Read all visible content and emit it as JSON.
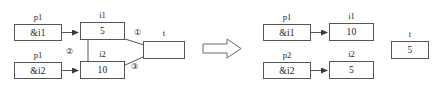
{
  "diagram": {
    "before": {
      "nodes": [
        {
          "id": "p1-left",
          "label": "p1",
          "value": "&i1"
        },
        {
          "id": "i1-left",
          "label": "i1",
          "value": "5"
        },
        {
          "id": "p1b-left",
          "label": "p1",
          "value": "&i2"
        },
        {
          "id": "i2-left",
          "label": "i2",
          "value": "10"
        },
        {
          "id": "t-left",
          "label": "t",
          "value": ""
        }
      ],
      "step_markers": [
        "①",
        "②",
        "③"
      ]
    },
    "after": {
      "nodes": [
        {
          "id": "p1-right",
          "label": "p1",
          "value": "&i1"
        },
        {
          "id": "i1-right",
          "label": "i1",
          "value": "10"
        },
        {
          "id": "p2-right",
          "label": "p2",
          "value": "&i2"
        },
        {
          "id": "i2-right",
          "label": "i2",
          "value": "5"
        },
        {
          "id": "t-right",
          "label": "t",
          "value": "5"
        }
      ]
    },
    "transition_arrow": "implies-arrow",
    "colors": {
      "stroke": "#555555",
      "text": "#1f1f1f",
      "background": "#ffffff",
      "box_fill": "#fdfdfd"
    }
  }
}
